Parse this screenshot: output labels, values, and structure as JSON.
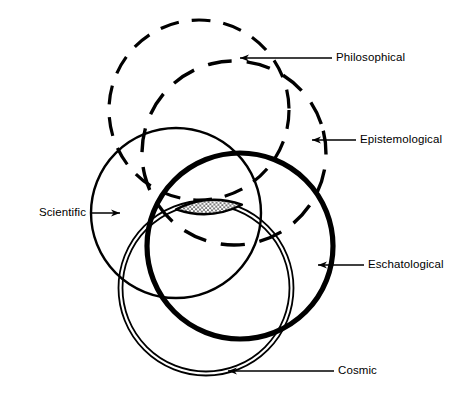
{
  "figure": {
    "kind": "venn-diagram",
    "background_color": "#ffffff",
    "ink_color": "#000000",
    "width": 456,
    "height": 420
  },
  "regions": [
    {
      "key": "philosophical",
      "label": "Philosophical",
      "style": "dashed",
      "cx": 199,
      "cy": 110,
      "r": 90,
      "stroke_width": 3.2,
      "dash": "19 13"
    },
    {
      "key": "epistemological",
      "label": "Epistemological",
      "style": "dashed",
      "cx": 234,
      "cy": 153,
      "r": 92,
      "stroke_width": 3.4,
      "dash": "24 15"
    },
    {
      "key": "scientific",
      "label": "Scientific",
      "style": "solid-thin",
      "cx": 176,
      "cy": 213,
      "r": 85,
      "stroke_width": 2.4,
      "dash": ""
    },
    {
      "key": "eschatological",
      "label": "Eschatological",
      "style": "solid-bold",
      "cx": 240,
      "cy": 246,
      "r": 93,
      "stroke_width": 5.2,
      "dash": ""
    },
    {
      "key": "cosmic",
      "label": "Cosmic",
      "style": "double-line",
      "cx": 206,
      "cy": 288,
      "r": 86,
      "stroke_width": 1.8,
      "dash": ""
    }
  ],
  "intersection": {
    "name": "common-core",
    "fill_pattern": "stipple-dots",
    "cx": 209,
    "cy": 207,
    "rx": 33,
    "ry": 9
  },
  "callouts": [
    {
      "key": "philosophical",
      "label": "Philosophical",
      "text_x": 336,
      "text_y": 58,
      "line_x1": 332,
      "line_x2": 240,
      "line_y": 58,
      "arrow": "left"
    },
    {
      "key": "epistemological",
      "label": "Epistemological",
      "text_x": 360,
      "text_y": 140,
      "line_x1": 356,
      "line_x2": 312,
      "line_y": 140,
      "arrow": "left"
    },
    {
      "key": "scientific",
      "label": "Scientific",
      "text_x": 30,
      "text_y": 213,
      "line_x1": 90,
      "line_x2": 120,
      "line_y": 213,
      "arrow": "right"
    },
    {
      "key": "eschatological",
      "label": "Eschatological",
      "text_x": 368,
      "text_y": 265,
      "line_x1": 364,
      "line_x2": 318,
      "line_y": 265,
      "arrow": "left"
    },
    {
      "key": "cosmic",
      "label": "Cosmic",
      "text_x": 338,
      "text_y": 371,
      "line_x1": 334,
      "line_x2": 228,
      "line_y": 371,
      "arrow": "left"
    }
  ]
}
